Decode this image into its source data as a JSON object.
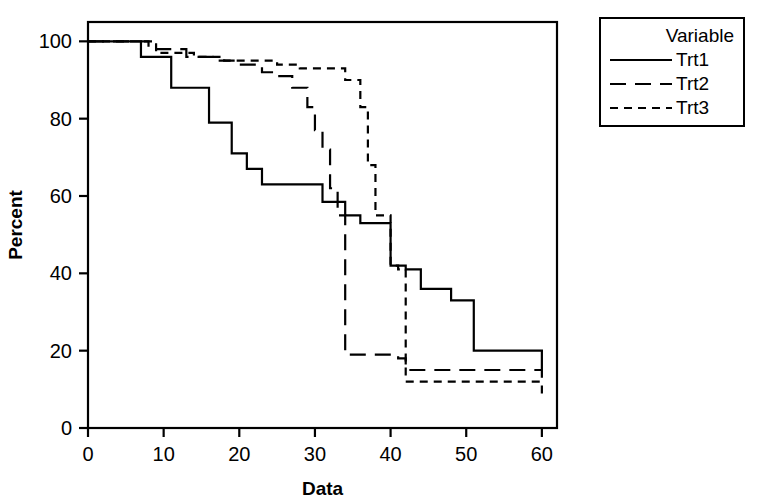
{
  "chart_data": {
    "type": "line",
    "title": "",
    "xlabel": "Data",
    "ylabel": "Percent",
    "xlim": [
      0,
      62
    ],
    "ylim": [
      0,
      105
    ],
    "xticks": [
      0,
      10,
      20,
      30,
      40,
      50,
      60
    ],
    "yticks": [
      0,
      20,
      40,
      60,
      80,
      100
    ],
    "grid": false,
    "step_type": "post",
    "legend": {
      "title": "Variable",
      "position": "outside-right-top",
      "entries": [
        {
          "name": "Trt1",
          "dash": "solid"
        },
        {
          "name": "Trt2",
          "dash": "long-dash"
        },
        {
          "name": "Trt3",
          "dash": "short-dash"
        }
      ]
    },
    "series": [
      {
        "name": "Trt1",
        "dash": "solid",
        "color": "#000000",
        "x": [
          0,
          4,
          7,
          11,
          16,
          19,
          21,
          23,
          26,
          31,
          33,
          34,
          36,
          38,
          40,
          42,
          44,
          48,
          51,
          60
        ],
        "y": [
          100,
          100,
          96,
          88,
          79,
          71,
          67,
          63,
          63,
          58.5,
          58.5,
          55,
          53,
          53,
          42,
          41,
          36,
          33,
          20,
          13
        ]
      },
      {
        "name": "Trt2",
        "dash": "long-dash",
        "color": "#000000",
        "x": [
          0,
          4,
          8,
          13,
          17,
          20,
          23,
          25,
          27,
          29,
          30,
          31,
          32,
          33,
          34,
          36,
          40,
          41,
          42,
          60
        ],
        "y": [
          100,
          100,
          98,
          96,
          95,
          94,
          92,
          91,
          88,
          83,
          77,
          72,
          62,
          55,
          19,
          19,
          19,
          18,
          15,
          15
        ]
      },
      {
        "name": "Trt3",
        "dash": "short-dash",
        "color": "#000000",
        "x": [
          0,
          4,
          9,
          14,
          18,
          22,
          25,
          28,
          31,
          34,
          35,
          36,
          37,
          38,
          40,
          41,
          42,
          53,
          60
        ],
        "y": [
          100,
          100,
          97,
          96,
          95,
          95,
          94,
          93,
          93,
          90,
          90,
          83,
          68,
          55,
          42,
          41,
          12,
          12,
          8.5
        ]
      }
    ]
  }
}
